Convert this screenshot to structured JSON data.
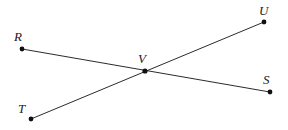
{
  "figure": {
    "canvas": {
      "width": 288,
      "height": 130
    },
    "background_color": "#ffffff",
    "line_color": "#2b2b2b",
    "point_color": "#101010",
    "label_color": "#1a1a1a",
    "line_width": 1,
    "point_radius": 2.4,
    "points": [
      {
        "id": "R",
        "label": "R",
        "x": 22,
        "y": 49,
        "label_x": 14,
        "label_y": 30
      },
      {
        "id": "U",
        "label": "U",
        "x": 264,
        "y": 22,
        "label_x": 259,
        "label_y": 4
      },
      {
        "id": "V",
        "label": "V",
        "x": 145,
        "y": 71,
        "label_x": 138,
        "label_y": 52
      },
      {
        "id": "S",
        "label": "S",
        "x": 270,
        "y": 92,
        "label_x": 263,
        "label_y": 73
      },
      {
        "id": "T",
        "label": "T",
        "x": 31,
        "y": 119,
        "label_x": 18,
        "label_y": 102
      }
    ],
    "segments": [
      {
        "id": "RS",
        "from": "R",
        "to": "S",
        "name": "segment-rs",
        "x1": 22,
        "y1": 49,
        "x2": 270,
        "y2": 92
      },
      {
        "id": "TU",
        "from": "T",
        "to": "U",
        "name": "segment-tu",
        "x1": 31,
        "y1": 119,
        "x2": 264,
        "y2": 22
      }
    ]
  }
}
